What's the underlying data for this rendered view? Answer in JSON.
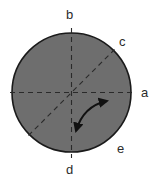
{
  "figure": {
    "title": "",
    "background_color": "#ffffff",
    "disk": {
      "name": "shaded-disk",
      "fill_color": "#6e6e6e",
      "stroke_color": "#1a1a1a",
      "center_x": 71.5,
      "center_y": 92.5,
      "radius": 60
    },
    "axes": [
      {
        "id": "vertical-axis",
        "style": "dashed",
        "color": "#2a2a2a",
        "from": "d",
        "to": "b"
      },
      {
        "id": "horizontal-axis",
        "style": "dashed",
        "color": "#2a2a2a",
        "from": "left-edge",
        "to": "a"
      },
      {
        "id": "diagonal-axis",
        "style": "dashed",
        "color": "#2a2a2a",
        "from": "e",
        "to": "c"
      }
    ],
    "arc_arrow": {
      "name": "double-headed-rotation-arrow",
      "color": "#111111",
      "heads": 2,
      "start_x": 76,
      "start_y": 131,
      "end_x": 107,
      "end_y": 101
    },
    "labels": [
      {
        "id": "b",
        "text": "b",
        "position": "top",
        "x": 66,
        "y": 8
      },
      {
        "id": "c",
        "text": "c",
        "position": "upper-right",
        "x": 119,
        "y": 35
      },
      {
        "id": "a",
        "text": "a",
        "position": "right",
        "x": 141,
        "y": 86
      },
      {
        "id": "e",
        "text": "e",
        "position": "lower-right",
        "x": 117,
        "y": 142
      },
      {
        "id": "d",
        "text": "d",
        "position": "bottom",
        "x": 66,
        "y": 163
      }
    ]
  }
}
